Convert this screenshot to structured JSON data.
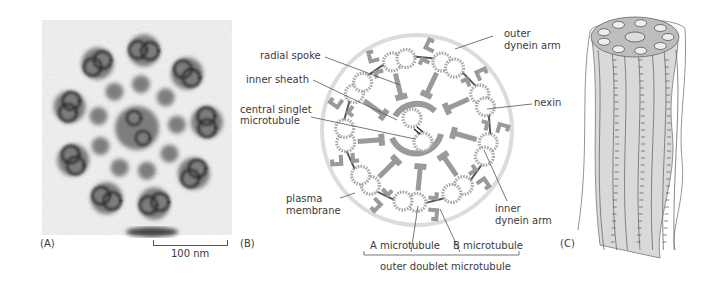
{
  "figure": {
    "panels": [
      {
        "id": "A",
        "letter": "(A)",
        "type": "electron-micrograph"
      },
      {
        "id": "B",
        "letter": "(B)",
        "type": "schematic-cross-section"
      },
      {
        "id": "C",
        "letter": "(C)",
        "type": "3d-illustration"
      }
    ],
    "scale_bar": {
      "label": "100 nm"
    },
    "labels": {
      "radial_spoke": "radial spoke",
      "inner_sheath": "inner sheath",
      "central_singlet_1": "central singlet",
      "central_singlet_2": "microtubule",
      "plasma_1": "plasma",
      "plasma_2": "membrane",
      "outer_dynein_1": "outer",
      "outer_dynein_2": "dynein arm",
      "nexin": "nexin",
      "inner_dynein_1": "inner",
      "inner_dynein_2": "dynein arm",
      "a_microtubule": "A microtubule",
      "b_microtubule": "B microtubule",
      "outer_doublet": "outer doublet microtubule"
    },
    "structure": {
      "outer_doublet_count": 9,
      "central_singlet_count": 2
    },
    "colors": {
      "schematic_gray": "#9a9a9a",
      "membrane_gray": "#dcdcdc",
      "tubule_dots": "#a8a8a8",
      "em_dark": "#2a2a2a",
      "cylinder_fill": "#d9d9d9"
    }
  }
}
